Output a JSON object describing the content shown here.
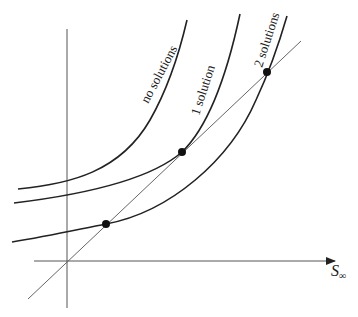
{
  "diagram": {
    "type": "intersection-curves",
    "x_axis_label": "S",
    "x_axis_subscript": "∞",
    "curves": [
      {
        "label": "no solutions",
        "intersections": 0
      },
      {
        "label": "1 solution",
        "intersections": 1
      },
      {
        "label": "2 solutions",
        "intersections": 2
      }
    ],
    "line": "straight line through origin",
    "points": [
      {
        "name": "tangent-point",
        "curve": "1 solution"
      },
      {
        "name": "lower-intersection",
        "curve": "2 solutions"
      },
      {
        "name": "upper-intersection",
        "curve": "2 solutions"
      }
    ],
    "colors": {
      "curve": "#222222",
      "axis": "#555555",
      "line": "#666666",
      "dot": "#111111",
      "background": "#ffffff"
    }
  }
}
